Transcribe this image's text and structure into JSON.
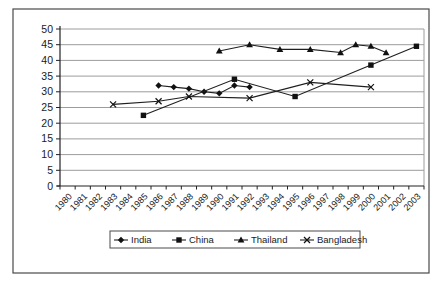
{
  "figure": {
    "border_color": "#4a4a4a",
    "background": "#ffffff"
  },
  "chart_data": {
    "type": "line",
    "title": "",
    "xlabel": "",
    "ylabel": "",
    "x_categories": [
      "1980",
      "1981",
      "1982",
      "1983",
      "1984",
      "1985",
      "1986",
      "1987",
      "1988",
      "1989",
      "1990",
      "1991",
      "1992",
      "1993",
      "1994",
      "1995",
      "1996",
      "1997",
      "1998",
      "1999",
      "2000",
      "2001",
      "2002",
      "2003"
    ],
    "ylim": [
      0,
      50
    ],
    "ytick_step": 5,
    "ytick_labels": [
      "0",
      "5",
      "10",
      "15",
      "20",
      "25",
      "30",
      "35",
      "40",
      "45",
      "50"
    ],
    "grid": true,
    "grid_color": "#9c9c9c",
    "line_color": "#1f1f1f",
    "marker_color": "#111111",
    "legend_position": "bottom",
    "series": [
      {
        "name": "India",
        "marker": "diamond",
        "points": [
          [
            1986,
            32
          ],
          [
            1987,
            31.5
          ],
          [
            1988,
            31
          ],
          [
            1989,
            30
          ],
          [
            1990,
            29.5
          ],
          [
            1991,
            32
          ],
          [
            1992,
            31.5
          ]
        ]
      },
      {
        "name": "China",
        "marker": "square",
        "points": [
          [
            1985,
            22.5
          ],
          [
            1991,
            34
          ],
          [
            1995,
            28.5
          ],
          [
            2000,
            38.5
          ],
          [
            2003,
            44.5
          ]
        ]
      },
      {
        "name": "Thailand",
        "marker": "triangle",
        "points": [
          [
            1990,
            43
          ],
          [
            1992,
            45
          ],
          [
            1994,
            43.5
          ],
          [
            1996,
            43.5
          ],
          [
            1998,
            42.5
          ],
          [
            1999,
            45
          ],
          [
            2000,
            44.5
          ],
          [
            2001,
            42.5
          ]
        ]
      },
      {
        "name": "Bangladesh",
        "marker": "x",
        "points": [
          [
            1983,
            26
          ],
          [
            1986,
            27
          ],
          [
            1988,
            28.5
          ],
          [
            1992,
            28
          ],
          [
            1996,
            33
          ],
          [
            2000,
            31.5
          ]
        ]
      }
    ]
  }
}
